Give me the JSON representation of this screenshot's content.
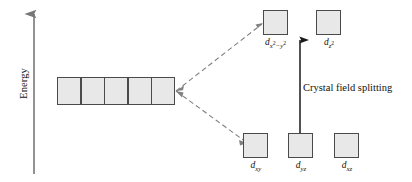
{
  "diagram": {
    "background_color": "#ffffff",
    "axis": {
      "label": "Energy",
      "orientation": "vertical",
      "arrow_direction": "up",
      "color": "#777777"
    },
    "caption": "Crystal field splitting",
    "box_fill_color": "#e8e8e8",
    "box_border_color": "#4a4a4a",
    "connector_style": "dashed",
    "connector_color": "#808080",
    "degenerate_set": {
      "name": "free-ion degenerate d orbitals",
      "count": 5,
      "labels": [
        "",
        "",
        "",
        "",
        ""
      ]
    },
    "upper_level": {
      "name": "eg set",
      "orbitals": [
        {
          "symbol": "d",
          "sub": "x",
          "sub_exp": "2",
          "sub_tail": "−y",
          "sub_tail_exp": "2",
          "plain": "dx2−y2"
        },
        {
          "symbol": "d",
          "sub": "z",
          "sub_exp": "2",
          "sub_tail": "",
          "sub_tail_exp": "",
          "plain": "dz2"
        }
      ]
    },
    "lower_level": {
      "name": "t2g set",
      "orbitals": [
        {
          "symbol": "d",
          "sub": "xy",
          "plain": "dxy"
        },
        {
          "symbol": "d",
          "sub": "yz",
          "plain": "dyz"
        },
        {
          "symbol": "d",
          "sub": "xz",
          "plain": "dxz"
        }
      ]
    }
  }
}
